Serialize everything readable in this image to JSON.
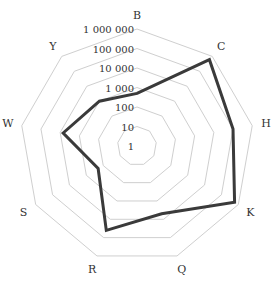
{
  "chart_data": {
    "type": "radar",
    "title": "",
    "scale": "log10",
    "axes": [
      "B",
      "C",
      "H",
      "K",
      "Q",
      "R",
      "S",
      "W",
      "Y"
    ],
    "series": [
      {
        "name": "",
        "values": [
          500,
          600000,
          100000,
          600000,
          5000,
          40000,
          200,
          7000,
          1000
        ]
      }
    ],
    "tick_values": [
      1,
      10,
      100,
      1000,
      10000,
      100000,
      1000000
    ],
    "tick_labels": [
      "1",
      "10",
      "100",
      "1 000",
      "10 000",
      "100 000",
      "1 000 000"
    ],
    "rlim": [
      1,
      1000000
    ],
    "grid": true,
    "legend": "none"
  },
  "style": {
    "line_color": "#3a3a3a",
    "grid_color": "#cfcfcf",
    "text_color": "#333333",
    "background": "#ffffff"
  }
}
